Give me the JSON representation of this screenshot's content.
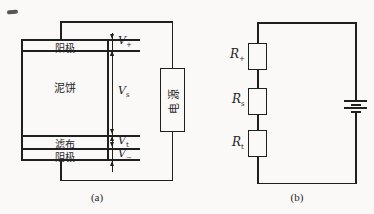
{
  "colors": {
    "ink": "#1f1f1f",
    "bg": "#faf9f7"
  },
  "panel_a": {
    "caption": "(a)",
    "layers": [
      {
        "label": "阳极"
      },
      {
        "label": "泥饼"
      },
      {
        "label": "滤布"
      },
      {
        "label": "阴极"
      }
    ],
    "power_label": "电源",
    "voltages": [
      {
        "base": "V",
        "sub": "+"
      },
      {
        "base": "V",
        "sub": "s"
      },
      {
        "base": "V",
        "sub": "t"
      },
      {
        "base": "V",
        "sub": "−"
      }
    ]
  },
  "panel_b": {
    "caption": "(b)",
    "resistors": [
      {
        "base": "R",
        "sub": "+"
      },
      {
        "base": "R",
        "sub": "s"
      },
      {
        "base": "R",
        "sub": "t"
      }
    ]
  }
}
